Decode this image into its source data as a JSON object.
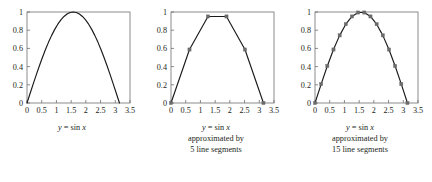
{
  "figure": {
    "background_color": "#ffffff",
    "axis_color": "#6f6f6f",
    "curve_color": "#1a1a1a",
    "marker_color": "#6b6b6b",
    "text_color": "#231f20"
  },
  "panels": [
    {
      "id": "panel-exact-sine",
      "caption_lines": [
        "y = sin x"
      ],
      "caption_plain": "y = sin x",
      "chart_data": {
        "type": "line",
        "title": "y = sin x",
        "xlabel": "",
        "ylabel": "",
        "xlim": [
          0,
          3.5
        ],
        "ylim": [
          0,
          1
        ],
        "xticks": [
          "0",
          "0.5",
          "1",
          "1.5",
          "2",
          "2.5",
          "3",
          "3.5"
        ],
        "xtick_values": [
          0,
          0.5,
          1,
          1.5,
          2,
          2.5,
          3,
          3.5
        ],
        "yticks": [
          "0",
          "0.2",
          "0.4",
          "0.6",
          "0.8",
          "1"
        ],
        "ytick_values": [
          0,
          0.2,
          0.4,
          0.6,
          0.8,
          1
        ],
        "grid": false,
        "legend": "none",
        "markers": false,
        "series": [
          {
            "name": "sin x",
            "x": [
              0,
              0.10472,
              0.20944,
              0.31416,
              0.41888,
              0.5236,
              0.62832,
              0.73304,
              0.83776,
              0.94248,
              1.0472,
              1.15192,
              1.25664,
              1.36136,
              1.46608,
              1.5708,
              1.67552,
              1.78024,
              1.88496,
              1.98968,
              2.0944,
              2.19911,
              2.30383,
              2.40855,
              2.51327,
              2.61799,
              2.72271,
              2.82743,
              2.93215,
              3.03687,
              3.14159
            ],
            "y": [
              0,
              0.1045,
              0.2079,
              0.309,
              0.4067,
              0.5,
              0.5878,
              0.6691,
              0.7431,
              0.809,
              0.866,
              0.9135,
              0.9511,
              0.9781,
              0.9945,
              1.0,
              0.9945,
              0.9781,
              0.9511,
              0.9135,
              0.866,
              0.809,
              0.7431,
              0.6691,
              0.5878,
              0.5,
              0.4067,
              0.309,
              0.2079,
              0.1045,
              0
            ]
          }
        ]
      }
    },
    {
      "id": "panel-5-segments",
      "caption_lines": [
        "y = sin x",
        "approximated by",
        "5 line segments"
      ],
      "caption_plain": "y = sin x approximated by 5 line segments",
      "chart_data": {
        "type": "line",
        "title": "y = sin x approximated by 5 line segments",
        "xlabel": "",
        "ylabel": "",
        "xlim": [
          0,
          3.5
        ],
        "ylim": [
          0,
          1
        ],
        "xticks": [
          "0",
          "0.5",
          "1",
          "1.5",
          "2",
          "2.5",
          "3",
          "3.5"
        ],
        "xtick_values": [
          0,
          0.5,
          1,
          1.5,
          2,
          2.5,
          3,
          3.5
        ],
        "yticks": [
          "0",
          "0.2",
          "0.4",
          "0.6",
          "0.8",
          "1"
        ],
        "ytick_values": [
          0,
          0.2,
          0.4,
          0.6,
          0.8,
          1
        ],
        "grid": false,
        "legend": "none",
        "markers": true,
        "segments": 5,
        "series": [
          {
            "name": "5-segment approximation of sin x",
            "x": [
              0,
              0.62832,
              1.25664,
              1.88496,
              2.51327,
              3.14159
            ],
            "y": [
              0,
              0.5878,
              0.9511,
              0.9511,
              0.5878,
              0
            ]
          }
        ]
      }
    },
    {
      "id": "panel-15-segments",
      "caption_lines": [
        "y = sin x",
        "approximated by",
        "15 line segments"
      ],
      "caption_plain": "y = sin x approximated by 15 line segments",
      "chart_data": {
        "type": "line",
        "title": "y = sin x approximated by 15 line segments",
        "xlabel": "",
        "ylabel": "",
        "xlim": [
          0,
          3.5
        ],
        "ylim": [
          0,
          1
        ],
        "xticks": [
          "0",
          "0.5",
          "1",
          "1.5",
          "2",
          "2.5",
          "3",
          "3.5"
        ],
        "xtick_values": [
          0,
          0.5,
          1,
          1.5,
          2,
          2.5,
          3,
          3.5
        ],
        "yticks": [
          "0",
          "0.2",
          "0.4",
          "0.6",
          "0.8",
          "1"
        ],
        "ytick_values": [
          0,
          0.2,
          0.4,
          0.6,
          0.8,
          1
        ],
        "grid": false,
        "legend": "none",
        "markers": true,
        "segments": 15,
        "series": [
          {
            "name": "15-segment approximation of sin x",
            "x": [
              0,
              0.20944,
              0.41888,
              0.62832,
              0.83776,
              1.0472,
              1.25664,
              1.46608,
              1.67552,
              1.88496,
              2.0944,
              2.30383,
              2.51327,
              2.72271,
              2.93215,
              3.14159
            ],
            "y": [
              0,
              0.2079,
              0.4067,
              0.5878,
              0.7431,
              0.866,
              0.9511,
              0.9945,
              0.9945,
              0.9511,
              0.866,
              0.7431,
              0.5878,
              0.4067,
              0.2079,
              0
            ]
          }
        ]
      }
    }
  ]
}
